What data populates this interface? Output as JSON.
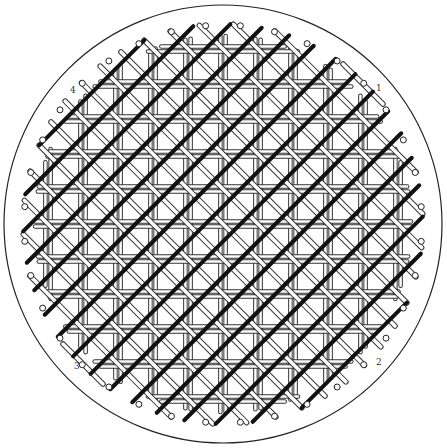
{
  "diagram": {
    "canvas": {
      "width": 447,
      "height": 448,
      "background": "#ffffff"
    },
    "outer_circle": {
      "cx": 223,
      "cy": 224,
      "r": 219,
      "stroke": "#222222",
      "stroke_width": 1.2
    },
    "weave_area": {
      "cx": 223,
      "cy": 224,
      "r": 200
    },
    "grid": {
      "pitch": 17.5,
      "origin_x": 223,
      "origin_y": 224
    },
    "strands": {
      "vertical": {
        "style": "double-line",
        "color": "#333333",
        "fill": "#ffffff",
        "width": 4.5
      },
      "horizontal": {
        "style": "double-line",
        "color": "#333333",
        "fill": "#ffffff",
        "width": 4.5
      },
      "diagonal_down": {
        "style": "double-line",
        "color": "#333333",
        "fill": "#ffffff",
        "width": 5.5
      },
      "diagonal_up": {
        "style": "solid-thick",
        "color": "#111111",
        "width": 4
      }
    },
    "pegs": {
      "count_per_side_estimate": 36,
      "ring_r": 199,
      "peg_r": 3,
      "stroke": "#222222",
      "fill": "#ffffff"
    },
    "corner_labels": [
      {
        "text": "1",
        "x": 376,
        "y": 91
      },
      {
        "text": "2",
        "x": 376,
        "y": 365
      },
      {
        "text": "3",
        "x": 74,
        "y": 369
      },
      {
        "text": "4",
        "x": 70,
        "y": 93
      }
    ]
  }
}
